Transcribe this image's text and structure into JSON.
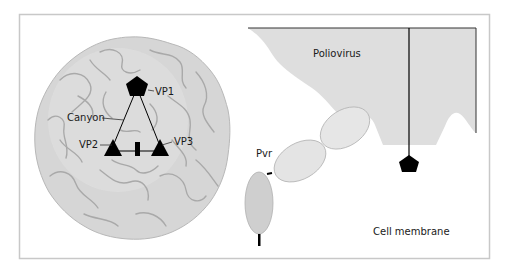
{
  "figure": {
    "left_panel": {
      "subject": "Poliovirus capsid",
      "labels": {
        "vp1": "VP1",
        "vp2": "VP2",
        "vp3": "VP3",
        "canyon": "Canyon"
      }
    },
    "right_panel": {
      "labels": {
        "poliovirus": "Poliovirus",
        "pvr": "Pvr",
        "cell_membrane": "Cell membrane"
      }
    },
    "colors": {
      "frame": "#c8c8c8",
      "capsid_fill": "#d6d6d6",
      "capsid_ridge": "#a9a9a9",
      "poliovirus_fill": "#dedede",
      "receptor_fill": "#e6e6e6",
      "receptor_base_fill": "#cfcfcf",
      "marker": "#000000"
    }
  }
}
